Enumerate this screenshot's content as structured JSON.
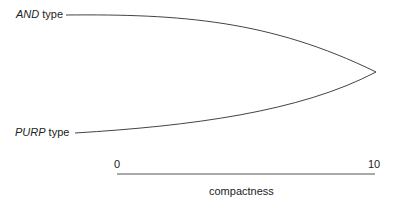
{
  "diagram": {
    "upper_label": {
      "italic": "AND",
      "rest": " type"
    },
    "lower_label": {
      "italic": "PURP",
      "rest": " type"
    },
    "axis": {
      "min_label": "0",
      "max_label": "10",
      "title": "compactness"
    }
  }
}
